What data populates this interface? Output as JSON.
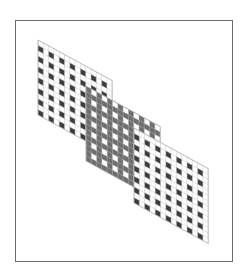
{
  "figure": {
    "colors": {
      "background": "#ffffff",
      "frame": "#6a6a6a",
      "grid_line": "#bdbdbd",
      "dark_cell": "#3c3c3c",
      "gray_cell": "#6e6e6e",
      "light_cell": "#ffffff"
    },
    "grids": [
      {
        "name": "upper-left-grid",
        "columns": 14,
        "rows": 14,
        "pattern": "sparse",
        "shading": "dark"
      },
      {
        "name": "middle-grid",
        "columns": 14,
        "rows": 14,
        "pattern": "dense",
        "shading": "gray"
      },
      {
        "name": "lower-right-grid",
        "columns": 14,
        "rows": 14,
        "pattern": "sparse",
        "shading": "dark"
      }
    ]
  }
}
